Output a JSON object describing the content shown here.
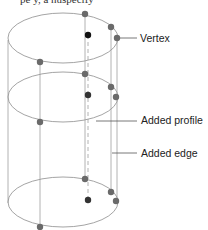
{
  "top_fragment": "pe                    y, a nuspecify",
  "labels": {
    "vertex": "Vertex",
    "added_profile": "Added profile",
    "added_edge": "Added edge"
  },
  "colors": {
    "line": "#9a9a9a",
    "dot": "#6a6a6a",
    "center_dot": "#111111",
    "text": "#222222"
  }
}
